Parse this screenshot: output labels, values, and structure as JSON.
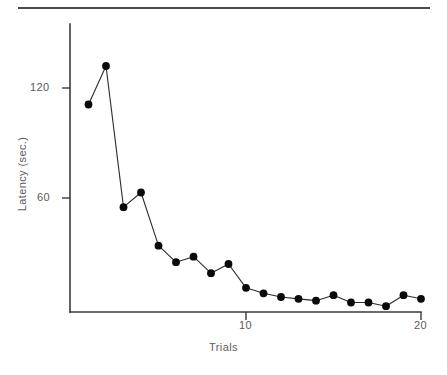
{
  "figure": {
    "name": "latency-by-trials-line-chart",
    "has_top_rule": true,
    "background_color": "#ffffff",
    "line_color": "#2b2b2b",
    "marker_color": "#0a0a0a",
    "axis_color": "#3a3a3a",
    "label_color": "#5b5b5b"
  },
  "chart_data": {
    "type": "line",
    "title": "",
    "xlabel": "Trials",
    "ylabel": "Latency (sec.)",
    "x": [
      1,
      2,
      3,
      4,
      5,
      6,
      7,
      8,
      9,
      10,
      11,
      12,
      13,
      14,
      15,
      16,
      17,
      18,
      19,
      20
    ],
    "values": [
      111,
      132,
      55,
      63,
      34,
      25,
      28,
      19,
      24,
      11,
      8,
      6,
      5,
      4,
      7,
      3,
      3,
      1,
      7,
      5
    ],
    "series": [
      {
        "name": "Latency",
        "values": [
          111,
          132,
          55,
          63,
          34,
          25,
          28,
          19,
          24,
          11,
          8,
          6,
          5,
          4,
          7,
          3,
          3,
          1,
          7,
          5
        ]
      }
    ],
    "xlim": [
      0,
      20.6
    ],
    "ylim": [
      -2,
      147
    ],
    "xticks": [
      10,
      20
    ],
    "xtick_labels": [
      "10",
      "20"
    ],
    "yticks": [
      60,
      120
    ],
    "ytick_labels": [
      "60",
      "120"
    ],
    "grid": false,
    "legend": false,
    "marker": "filled-circle",
    "annotations": []
  },
  "axis": {
    "y_tick_120": "120",
    "y_tick_60": "60",
    "x_tick_10": "10",
    "x_tick_20": "20",
    "x_title": "Trials",
    "y_title": "Latency (sec.)"
  }
}
